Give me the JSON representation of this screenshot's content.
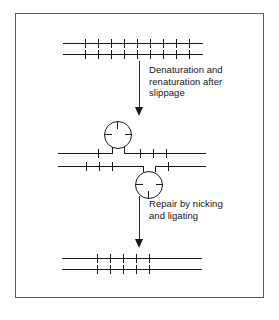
{
  "figure": {
    "frame_color": "#5a5a5a",
    "ink_color": "#1b1b1b",
    "background_color": "#ffffff"
  },
  "steps": [
    {
      "id": "step-1",
      "name": "original-duplex",
      "label": "Original DNA duplex with repeated units"
    },
    {
      "id": "step-2",
      "name": "slipped-duplex",
      "label": "Mispaired duplex with two single-strand loops"
    },
    {
      "id": "step-3",
      "name": "repaired-duplex",
      "label": "Repaired, shortened duplex"
    }
  ],
  "arrows": [
    {
      "id": "arrow-1",
      "name": "denaturation-arrow",
      "caption": "Denaturation and\nrenaturation after\nslippage"
    },
    {
      "id": "arrow-2",
      "name": "repair-arrow",
      "caption": "Repair by nicking\nand ligating"
    }
  ],
  "diagram_data": {
    "type": "diagram",
    "panels": [
      {
        "name": "top-duplex",
        "strands": [
          {
            "name": "top-strand",
            "x": 63,
            "y": 42,
            "length": 140,
            "tick_count": 9,
            "tick_start": 22,
            "tick_spacing": 13.5,
            "tick_height": 9,
            "tick_offset": -4
          },
          {
            "name": "bottom-strand",
            "x": 63,
            "y": 53,
            "length": 140,
            "tick_count": 9,
            "tick_start": 22,
            "tick_spacing": 13.5,
            "tick_height": 9,
            "tick_offset": -4
          }
        ]
      },
      {
        "name": "middle-duplex",
        "strands": [
          {
            "name": "top-strand",
            "x": 58,
            "y": 152,
            "length": 148,
            "tick_count": 4,
            "tick_start": 40,
            "tick_spacing": 13.5,
            "tick_height": 9,
            "tick_offset": -4
          },
          {
            "name": "bottom-strand",
            "x": 58,
            "y": 165,
            "length": 148,
            "tick_count": 4,
            "tick_start": 28,
            "tick_spacing": 13.5,
            "tick_height": 9,
            "tick_offset": -4
          }
        ],
        "loops": [
          {
            "name": "upper-loop",
            "cx": 117,
            "cy": 134,
            "r": 14
          },
          {
            "name": "lower-loop",
            "cx": 147,
            "cy": 183,
            "r": 14
          }
        ]
      },
      {
        "name": "bottom-duplex",
        "strands": [
          {
            "name": "top-strand",
            "x": 62,
            "y": 257,
            "length": 140,
            "tick_count": 5,
            "tick_start": 35,
            "tick_spacing": 13.5,
            "tick_height": 9,
            "tick_offset": -4
          },
          {
            "name": "bottom-strand",
            "x": 62,
            "y": 268,
            "length": 140,
            "tick_count": 5,
            "tick_start": 35,
            "tick_spacing": 13.5,
            "tick_height": 9,
            "tick_offset": -4
          }
        ]
      }
    ]
  }
}
